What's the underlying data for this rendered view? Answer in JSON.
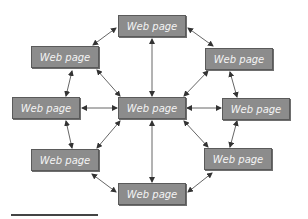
{
  "diagram": {
    "type": "hub-and-ring web page network",
    "nodes": [
      {
        "id": "top",
        "label": "Web page",
        "x": 118,
        "y": 15
      },
      {
        "id": "upper-left",
        "label": "Web page",
        "x": 31,
        "y": 46
      },
      {
        "id": "upper-right",
        "label": "Web page",
        "x": 205,
        "y": 48
      },
      {
        "id": "left",
        "label": "Web page",
        "x": 12,
        "y": 97
      },
      {
        "id": "center",
        "label": "Web page",
        "x": 118,
        "y": 97
      },
      {
        "id": "right",
        "label": "Web page",
        "x": 222,
        "y": 98
      },
      {
        "id": "lower-left",
        "label": "Web page",
        "x": 31,
        "y": 149
      },
      {
        "id": "lower-right",
        "label": "Web page",
        "x": 204,
        "y": 148
      },
      {
        "id": "bottom",
        "label": "Web page",
        "x": 118,
        "y": 183
      }
    ],
    "edges": [
      [
        "center",
        "top"
      ],
      [
        "center",
        "upper-left"
      ],
      [
        "center",
        "upper-right"
      ],
      [
        "center",
        "left"
      ],
      [
        "center",
        "right"
      ],
      [
        "center",
        "lower-left"
      ],
      [
        "center",
        "lower-right"
      ],
      [
        "center",
        "bottom"
      ],
      [
        "top",
        "upper-left"
      ],
      [
        "top",
        "upper-right"
      ],
      [
        "upper-left",
        "left"
      ],
      [
        "upper-right",
        "right"
      ],
      [
        "left",
        "lower-left"
      ],
      [
        "right",
        "lower-right"
      ],
      [
        "lower-left",
        "bottom"
      ],
      [
        "lower-right",
        "bottom"
      ]
    ],
    "edge_style": "bidirectional arrows",
    "colors": {
      "node_fill": "#8c8c8c",
      "node_border": "#5a5a5a",
      "node_text": "#f4f4f4",
      "edge": "#555555"
    }
  }
}
